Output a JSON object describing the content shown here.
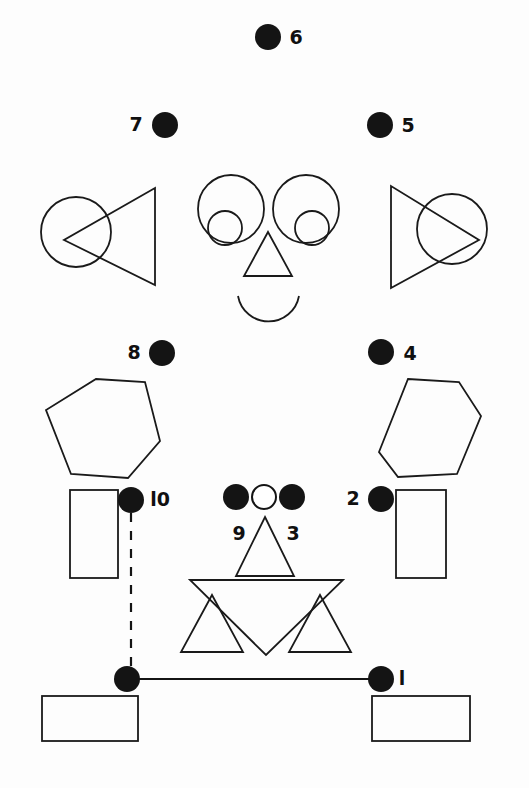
{
  "canvas": {
    "width": 529,
    "height": 788,
    "background": "#fdfdfd",
    "ink": "#1a1a1a",
    "dot_fill": "#141414"
  },
  "labels": {
    "n1": "l",
    "n2": "2",
    "n3": "3",
    "n4": "4",
    "n5": "5",
    "n6": "6",
    "n7": "7",
    "n8": "8",
    "n9": "9",
    "n10": "l0"
  },
  "dots": [
    {
      "id": "dot-6",
      "label": "6",
      "cx": 268,
      "cy": 37,
      "r": 13,
      "filled": true,
      "label_x": 296,
      "label_y": 38
    },
    {
      "id": "dot-7",
      "label": "7",
      "cx": 165,
      "cy": 125,
      "r": 13,
      "filled": true,
      "label_x": 136,
      "label_y": 125
    },
    {
      "id": "dot-5",
      "label": "5",
      "cx": 380,
      "cy": 125,
      "r": 13,
      "filled": true,
      "label_x": 408,
      "label_y": 126
    },
    {
      "id": "dot-8",
      "label": "8",
      "cx": 162,
      "cy": 353,
      "r": 13,
      "filled": true,
      "label_x": 134,
      "label_y": 353
    },
    {
      "id": "dot-4",
      "label": "4",
      "cx": 381,
      "cy": 352,
      "r": 13,
      "filled": true,
      "label_x": 410,
      "label_y": 354
    },
    {
      "id": "dot-10",
      "label": "l0",
      "cx": 131,
      "cy": 500,
      "r": 13,
      "filled": true,
      "label_x": 160,
      "label_y": 500
    },
    {
      "id": "dot-2",
      "label": "2",
      "cx": 381,
      "cy": 499,
      "r": 13,
      "filled": true,
      "label_x": 353,
      "label_y": 499
    },
    {
      "id": "dot-9",
      "label": "9",
      "cx": 236,
      "cy": 497,
      "r": 13,
      "filled": true,
      "label_x": 239,
      "label_y": 534
    },
    {
      "id": "dot-center",
      "label": "",
      "cx": 264,
      "cy": 497,
      "r": 12,
      "filled": false,
      "label_x": 0,
      "label_y": 0
    },
    {
      "id": "dot-3",
      "label": "3",
      "cx": 292,
      "cy": 497,
      "r": 13,
      "filled": true,
      "label_x": 293,
      "label_y": 534
    },
    {
      "id": "dot-hip-left",
      "label": "",
      "cx": 127,
      "cy": 679,
      "r": 13,
      "filled": true,
      "label_x": 0,
      "label_y": 0
    },
    {
      "id": "dot-1",
      "label": "l",
      "cx": 381,
      "cy": 679,
      "r": 13,
      "filled": true,
      "label_x": 402,
      "label_y": 679
    }
  ],
  "shapes": {
    "left_ear_circle": {
      "cx": 76,
      "cy": 232,
      "r": 35
    },
    "right_ear_circle": {
      "cx": 452,
      "cy": 229,
      "r": 35
    },
    "left_ear_triangle": "M 155,188 L 155,285 L 64,240 Z",
    "right_ear_triangle": "M 391,186 L 391,288 L 479,240 Z",
    "left_eye_outer": {
      "cx": 231,
      "cy": 209,
      "rx": 33,
      "ry": 34
    },
    "right_eye_outer": {
      "cx": 306,
      "cy": 209,
      "rx": 33,
      "ry": 34
    },
    "left_eye_inner": {
      "cx": 225,
      "cy": 228,
      "r": 17
    },
    "right_eye_inner": {
      "cx": 312,
      "cy": 228,
      "r": 17
    },
    "nose_triangle": "M 268,232 L 292,276 L 244,276 Z",
    "mouth_arc": "M 238,296 A 31 31 0 0 0 299,296",
    "left_hexagon": "M 96,379 L 145,382 L 160,441 L 128,478 L 71,474 L 46,410 Z",
    "right_hexagon": "M 408,379 L 459,382 L 481,416 L 457,474 L 398,477 L 379,452 Z",
    "left_upper_rect": {
      "x": 70,
      "y": 490,
      "w": 48,
      "h": 88
    },
    "right_upper_rect": {
      "x": 396,
      "y": 490,
      "w": 50,
      "h": 88
    },
    "left_base_rect": {
      "x": 42,
      "y": 696,
      "w": 96,
      "h": 45
    },
    "right_base_rect": {
      "x": 372,
      "y": 696,
      "w": 98,
      "h": 45
    },
    "small_top_triangle": "M 265,517 L 294,576 L 236,576 Z",
    "big_down_triangle": "M 190,580 L 343,580 L 266,655 Z",
    "left_small_triangle": "M 212,595 L 243,652 L 181,652 Z",
    "right_small_triangle": "M 320,595 L 351,652 L 289,652 Z",
    "dashed_stem": "M 131,513 L 131,666",
    "hip_connector": "M 127,679 L 381,679"
  }
}
